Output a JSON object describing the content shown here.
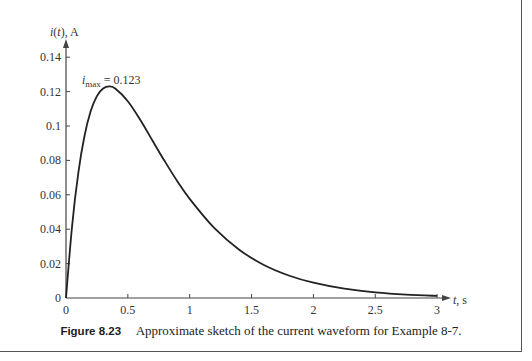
{
  "figure": {
    "number_label": "Figure 8.23",
    "caption": "Approximate sketch of the current waveform for Example 8-7."
  },
  "chart_data": {
    "type": "line",
    "title": "",
    "xlabel": "t, s",
    "ylabel": "i(t), A",
    "xlim": [
      0,
      3
    ],
    "ylim": [
      0,
      0.14
    ],
    "x_ticks": [
      "0",
      "0.5",
      "1",
      "1.5",
      "2",
      "2.5",
      "3"
    ],
    "y_ticks": [
      "0",
      "0.02",
      "0.04",
      "0.06",
      "0.08",
      "0.1",
      "0.12",
      "0.14"
    ],
    "grid": false,
    "annotation": {
      "text_main": "i",
      "text_sub": "max",
      "text_rest": " = 0.123",
      "x": 0.347,
      "y": 0.123
    },
    "series": [
      {
        "name": "i(t)",
        "x": [
          0,
          0.05,
          0.1,
          0.15,
          0.2,
          0.25,
          0.3,
          0.35,
          0.4,
          0.5,
          0.6,
          0.7,
          0.8,
          0.9,
          1.0,
          1.2,
          1.4,
          1.6,
          1.8,
          2.0,
          2.25,
          2.5,
          2.75,
          3.0
        ],
        "values": [
          0,
          0.0424,
          0.073,
          0.0945,
          0.1087,
          0.1174,
          0.1218,
          0.123,
          0.1217,
          0.1144,
          0.1036,
          0.0914,
          0.0793,
          0.0679,
          0.0576,
          0.0406,
          0.0281,
          0.0192,
          0.0131,
          0.0089,
          0.0054,
          0.0033,
          0.002,
          0.0012
        ]
      }
    ]
  },
  "colors": {
    "curve": "#222222",
    "axis": "#444444",
    "text": "#333333"
  }
}
